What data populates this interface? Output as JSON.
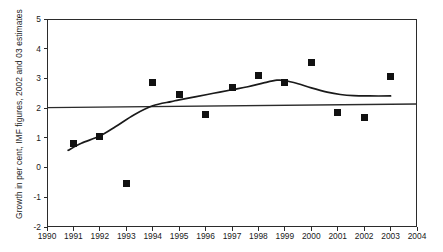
{
  "chart_data": {
    "type": "scatter",
    "title": "",
    "xlabel": "",
    "ylabel": "Growth in per cent, IMF figures, 2002 and 03 estimates",
    "xlim": [
      1990,
      2004
    ],
    "ylim": [
      -2,
      5
    ],
    "xticks": [
      1990,
      1991,
      1992,
      1993,
      1994,
      1995,
      1996,
      1997,
      1998,
      1999,
      2000,
      2001,
      2002,
      2003,
      2004
    ],
    "yticks": [
      -2,
      -1,
      0,
      1,
      2,
      3,
      4,
      5
    ],
    "xtick_labels": [
      "1990",
      "1991",
      "1992",
      "1993",
      "1994",
      "1995",
      "1996",
      "1997",
      "1998",
      "1999",
      "2000",
      "2001",
      "2002",
      "2003",
      "2004"
    ],
    "ytick_labels": [
      "-2",
      "-1",
      "0",
      "1",
      "2",
      "3",
      "4",
      "5"
    ],
    "grid": false,
    "legend": false,
    "marker_color": "#111111",
    "line_color": "#1a1a1a",
    "axis_color": "#2b2b2b",
    "series": [
      {
        "name": "Annual growth observations",
        "kind": "scatter",
        "marker": "square",
        "x": [
          1991,
          1992,
          1993,
          1994,
          1995,
          1996,
          1997,
          1998,
          1999,
          2000,
          2001,
          2002,
          2003
        ],
        "values": [
          0.82,
          1.05,
          -0.55,
          2.87,
          2.45,
          1.8,
          2.7,
          3.1,
          2.85,
          3.55,
          1.87,
          1.68,
          3.05
        ]
      },
      {
        "name": "Trend",
        "kind": "line",
        "x": [
          1990.8,
          1991.3,
          1992.0,
          1992.6,
          1993.3,
          1994.0,
          1994.7,
          1995.0,
          1995.6,
          1996.3,
          1997.0,
          1997.6,
          1998.2,
          1998.7,
          1999.0,
          1999.5,
          2000.0,
          2000.6,
          2001.1,
          2001.6,
          2002.2,
          2003.0
        ],
        "values": [
          0.58,
          0.82,
          1.06,
          1.38,
          1.78,
          2.08,
          2.22,
          2.28,
          2.38,
          2.5,
          2.62,
          2.72,
          2.85,
          2.94,
          2.93,
          2.82,
          2.68,
          2.54,
          2.46,
          2.42,
          2.41,
          2.41
        ]
      },
      {
        "name": "Reference level",
        "kind": "hline",
        "x": [
          1990,
          2004
        ],
        "values": [
          2.02,
          2.14
        ]
      }
    ]
  },
  "axis_title": {
    "y": "Growth in per cent, IMF figures, 2002 and 03 estimates"
  }
}
